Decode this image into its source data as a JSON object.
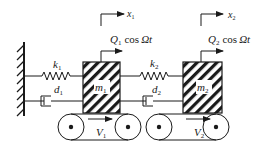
{
  "diagram": {
    "type": "two-mass spring-damper system on moving belts",
    "colors": {
      "stroke": "#1a1a1a",
      "background": "#ffffff"
    },
    "wall": {
      "name": "fixed-wall"
    },
    "springs": [
      {
        "id": "k1",
        "symbol": "k",
        "sub": "1"
      },
      {
        "id": "k2",
        "symbol": "k",
        "sub": "2"
      }
    ],
    "dampers": [
      {
        "id": "d1",
        "symbol": "d",
        "sub": "1"
      },
      {
        "id": "d2",
        "symbol": "d",
        "sub": "2"
      }
    ],
    "masses": [
      {
        "id": "m1",
        "symbol": "m",
        "sub": "1"
      },
      {
        "id": "m2",
        "symbol": "m",
        "sub": "2"
      }
    ],
    "forces": [
      {
        "id": "Q1",
        "symbol": "Q",
        "sub": "1",
        "expr": "cos",
        "arg": "Ωt"
      },
      {
        "id": "Q2",
        "symbol": "Q",
        "sub": "2",
        "expr": "cos",
        "arg": "Ωt"
      }
    ],
    "displacements": [
      {
        "id": "x1",
        "symbol": "x",
        "sub": "1"
      },
      {
        "id": "x2",
        "symbol": "x",
        "sub": "2"
      }
    ],
    "belts": [
      {
        "id": "V1",
        "symbol": "V",
        "sub": "1"
      },
      {
        "id": "V2",
        "symbol": "V",
        "sub": "2"
      }
    ]
  }
}
